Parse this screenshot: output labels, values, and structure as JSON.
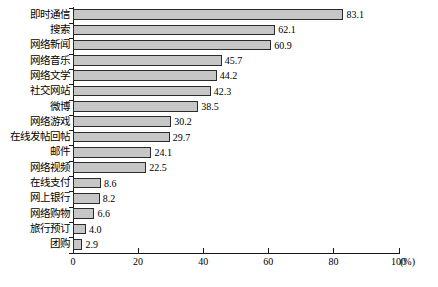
{
  "chart_data": {
    "type": "bar",
    "orientation": "horizontal",
    "title": "",
    "xlabel": "(%)",
    "ylabel": "",
    "xlim": [
      0,
      100
    ],
    "grid": false,
    "legend": null,
    "xticks": [
      0,
      20,
      40,
      60,
      80,
      100
    ],
    "xtick_labels": [
      "0",
      "20",
      "40",
      "60",
      "80",
      "100"
    ],
    "unit_label": "(%)",
    "bar_color": "#c6c6c6",
    "bar_border_color": "#2b2b2b",
    "axis_color": "#1a1a1a",
    "categories": [
      "即时通信",
      "搜索",
      "网络新闻",
      "网络音乐",
      "网络文学",
      "社交网站",
      "微博",
      "网络游戏",
      "在线发帖回帖",
      "邮件",
      "网络视频",
      "在线支付",
      "网上银行",
      "网络购物",
      "旅行预订",
      "团购"
    ],
    "values": [
      83.1,
      62.1,
      60.9,
      45.7,
      44.2,
      42.3,
      38.5,
      30.2,
      29.7,
      24.1,
      22.5,
      8.6,
      8.2,
      6.6,
      4.0,
      2.9
    ],
    "value_labels": [
      "83.1",
      "62.1",
      "60.9",
      "45.7",
      "44.2",
      "42.3",
      "38.5",
      "30.2",
      "29.7",
      "24.1",
      "22.5",
      "8.6",
      "8.2",
      "6.6",
      "4.0",
      "2.9"
    ]
  }
}
